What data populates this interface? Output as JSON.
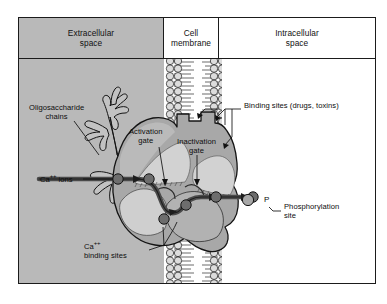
{
  "figure": {
    "headers": [
      {
        "id": "extracellular",
        "label": "Extracellular\nspace"
      },
      {
        "id": "membrane",
        "label": "Cell\nmembrane"
      },
      {
        "id": "intracellular",
        "label": "Intracellular\nspace"
      }
    ],
    "header_labels": {
      "extracellular_line1": "Extracellular",
      "extracellular_line2": "space",
      "membrane_line1": "Cell",
      "membrane_line2": "membrane",
      "intracellular_line1": "Intracellular",
      "intracellular_line2": "space"
    }
  },
  "labels": {
    "oligosaccharide_line1": "Oligosaccharide",
    "oligosaccharide_line2": "chains",
    "ca_ions": "Ca",
    "ca_ions_sup": "++",
    "ca_ions_tail": " ions",
    "ca_binding_line1": "Ca",
    "ca_binding_sup": "++",
    "ca_binding_line2": "binding sites",
    "activation_line1": "Activation",
    "activation_line2": "gate",
    "inactivation_line1": "Inactivation",
    "inactivation_line2": "gate",
    "binding_sites": "Binding sites (drugs, toxins)",
    "phosphorylation_line1": "Phosphorylation",
    "phosphorylation_line2": "site",
    "phosphate_marker": "P"
  },
  "colors": {
    "extracellular_bg": "#b9b9b9",
    "intracellular_bg": "#ffffff",
    "protein_body": "#a8a8a8",
    "protein_body_light": "#c6c6c6",
    "protein_shadow": "#8f8f8f",
    "lipid_head_fill": "#dcdcdc",
    "ion_fill": "#6d6d6d",
    "ion_path": "#4a4a4a",
    "outline": "#141414",
    "text": "#0d0d0d"
  },
  "elements": {
    "lipid_bilayer": "phospholipid bilayer drawn as two vertical columns of circular head groups with paired tails",
    "channel_protein": "transmembrane calcium channel protein spanning the bilayer",
    "ion_pathway": "Ca++ ions traversing pore from extracellular to intracellular side",
    "ion_count": 6,
    "oligosaccharide_branches": 4
  }
}
